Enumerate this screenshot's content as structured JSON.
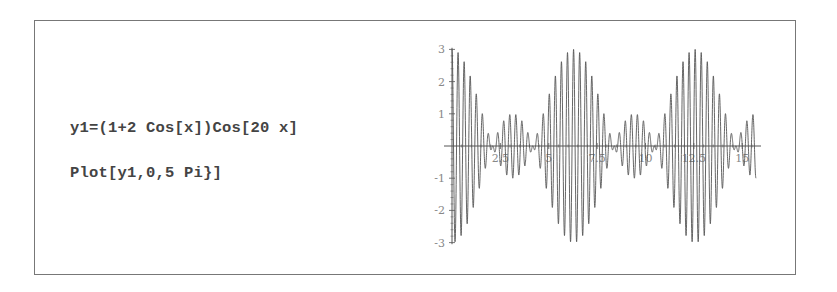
{
  "code": {
    "line1": "y1=(1+2 Cos[x])Cos[20 x]",
    "line2": "Plot[y1,0,5 Pi}]"
  },
  "chart_data": {
    "type": "line",
    "title": "",
    "function": "(1+2 Cos[x]) Cos[20 x]",
    "xlabel": "",
    "ylabel": "",
    "xlim": [
      0,
      15.708
    ],
    "ylim": [
      -3,
      3
    ],
    "x_ticks": [
      2.5,
      5,
      7.5,
      10,
      12.5,
      15
    ],
    "x_tick_labels": [
      "2.5",
      "5",
      "7.5",
      "10",
      "12.5",
      "15"
    ],
    "y_ticks": [
      -3,
      -2,
      -1,
      1,
      2,
      3
    ],
    "y_tick_labels": [
      "-3",
      "-2",
      "-1",
      "1",
      "2",
      "3"
    ],
    "grid": false,
    "legend": null,
    "series": [
      {
        "name": "y1",
        "color": "#555555",
        "samples": 3000
      }
    ]
  },
  "colors": {
    "frame": "#777777",
    "curve": "#555555",
    "axis": "#555555",
    "tick_label": "#888888"
  }
}
